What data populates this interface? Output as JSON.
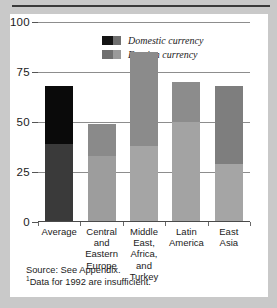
{
  "chart_data": {
    "type": "bar",
    "subtype": "stacked",
    "title": "",
    "xlabel": "",
    "ylabel": "",
    "ylim": [
      0,
      100
    ],
    "yticks": [
      0,
      25,
      50,
      75,
      100
    ],
    "ytick_labels": [
      "0",
      "25",
      "50",
      "75",
      "100"
    ],
    "grid": true,
    "legend_position": "top-center",
    "categories": [
      "Average",
      "Central and Eastern Europe",
      "Middle East, Africa, and Turkey",
      "Latin America",
      "East Asia"
    ],
    "category_lines": [
      [
        "Average"
      ],
      [
        "Central",
        "and",
        "Eastern",
        "Europe"
      ],
      [
        "Middle",
        "East,",
        "Africa,",
        "and",
        "Turkey"
      ],
      [
        "Latin",
        "America"
      ],
      [
        "East",
        "Asia"
      ]
    ],
    "series": [
      {
        "name": "Foreign currency",
        "values": [
          39,
          33,
          38,
          50,
          29
        ],
        "colors": [
          "#3a3a3a",
          "#9d9d9d",
          "#a5a5a5",
          "#a3a3a3",
          "#a5a5a5"
        ]
      },
      {
        "name": "Domestic currency",
        "values": [
          29,
          16,
          47,
          20,
          39
        ],
        "colors": [
          "#0a0a0a",
          "#8a8a8a",
          "#8b8b8b",
          "#8c8c8c",
          "#7e7e7e"
        ]
      }
    ],
    "totals": [
      68,
      49,
      85,
      70,
      68
    ]
  },
  "legend": {
    "items": [
      {
        "label": "Domestic currency",
        "swatch_left": "#141414",
        "swatch_right": "#6f6f6f"
      },
      {
        "label": "Foreign currency",
        "swatch_left": "#6f6f6f",
        "swatch_right": "#9a9a9a"
      }
    ]
  },
  "notes": {
    "source": "Source: See Appendix.",
    "footnote_marker": "1",
    "footnote": "Data for 1992 are insufficient."
  },
  "colors": {
    "page_background": "#c9c9c9",
    "panel_background": "#ffffff",
    "rule": "#3a3a3a",
    "gridline": "#8d8d8d",
    "axis": "#4a4a4a",
    "text": "#1b1b1b"
  }
}
